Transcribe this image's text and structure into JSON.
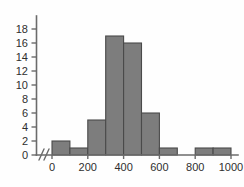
{
  "chart_data": {
    "type": "bar",
    "title": "",
    "subtitle": "",
    "xlabel": "",
    "ylabel": "",
    "bin_width": 100,
    "bin_edges": [
      0,
      100,
      200,
      300,
      400,
      500,
      600,
      700,
      800,
      900,
      1000
    ],
    "categories": [
      "0-100",
      "100-200",
      "200-300",
      "300-400",
      "400-500",
      "500-600",
      "600-700",
      "700-800",
      "800-900",
      "900-1000"
    ],
    "values": [
      2,
      1,
      5,
      17,
      16,
      6,
      1,
      0,
      1,
      1
    ],
    "xlim": [
      0,
      1000
    ],
    "ylim": [
      0,
      19
    ],
    "x_ticks": [
      0,
      200,
      400,
      600,
      800,
      1000
    ],
    "x_tick_labels": [
      "0",
      "200",
      "400",
      "600",
      "800",
      "1000"
    ],
    "y_ticks": [
      0,
      2,
      4,
      6,
      8,
      10,
      12,
      14,
      16,
      18
    ],
    "y_tick_labels": [
      "0",
      "2",
      "4",
      "6",
      "8",
      "10",
      "12",
      "14",
      "16",
      "18"
    ],
    "grid": false,
    "legend": false,
    "axis_break": "//",
    "colors": {
      "bar_fill": "#7d7d7d",
      "bar_edge": "#4a4a4a",
      "axis": "#6b6b6b",
      "text": "#2e2e2e",
      "background": "#fefefe"
    }
  }
}
